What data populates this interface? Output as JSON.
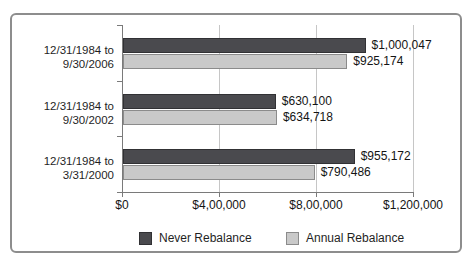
{
  "chart_data": {
    "type": "bar",
    "orientation": "horizontal",
    "title": "",
    "categories": [
      {
        "line1": "12/31/1984 to",
        "line2": "9/30/2006"
      },
      {
        "line1": "12/31/1984 to",
        "line2": "9/30/2002"
      },
      {
        "line1": "12/31/1984 to",
        "line2": "3/31/2000"
      }
    ],
    "series": [
      {
        "name": "Never Rebalance",
        "color": "#4a4a4e",
        "border_color": "#313134",
        "values": [
          1000047,
          630100,
          955172
        ],
        "value_labels": [
          "$1,000,047",
          "$630,100",
          "$955,172"
        ]
      },
      {
        "name": "Annual Rebalance",
        "color": "#c9c9c9",
        "border_color": "#8b8b8b",
        "values": [
          925174,
          634718,
          790486
        ],
        "value_labels": [
          "$925,174",
          "$634,718",
          "$790,486"
        ]
      }
    ],
    "x_axis": {
      "min": 0,
      "max": 1200000,
      "tick_values": [
        0,
        400000,
        800000,
        1200000
      ],
      "tick_labels": [
        "$0",
        "$4,00,000",
        "$8,00,000",
        "$1,200,000"
      ]
    },
    "grid": "vertical",
    "legend_position": "bottom",
    "colors": {
      "frame_border": "#8d8d8d",
      "axis": "#7a7a7a",
      "gridline": "#c6c6c6",
      "text": "#1a1a1a",
      "background": "#ffffff"
    }
  }
}
